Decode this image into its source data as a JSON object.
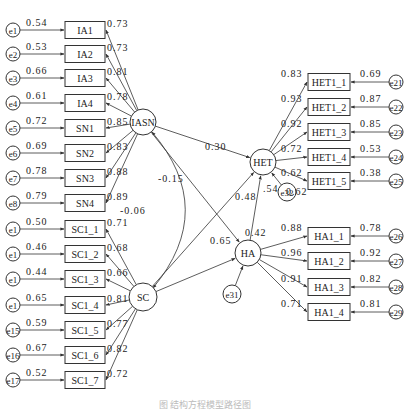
{
  "diagram": {
    "type": "structural-equation-model",
    "latent": [
      {
        "id": "IASN",
        "label": "IASN",
        "x": 143,
        "y": 122,
        "r": 13
      },
      {
        "id": "SC",
        "label": "SC",
        "x": 143,
        "y": 297,
        "r": 14
      },
      {
        "id": "HET",
        "label": "HET",
        "x": 263,
        "y": 162,
        "r": 13
      },
      {
        "id": "HA",
        "label": "HA",
        "x": 248,
        "y": 253,
        "r": 13
      }
    ],
    "left_indicators": [
      {
        "label": "IA1",
        "err": "e1",
        "err_load": "0.54",
        "loading": "0.73",
        "y": 30,
        "factor": "IASN"
      },
      {
        "label": "IA2",
        "err": "e2",
        "err_load": "0.53",
        "loading": "0.73",
        "y": 54,
        "factor": "IASN"
      },
      {
        "label": "IA3",
        "err": "e3",
        "err_load": "0.66",
        "loading": "0.81",
        "y": 78,
        "factor": "IASN"
      },
      {
        "label": "IA4",
        "err": "e4",
        "err_load": "0.61",
        "loading": "0.78",
        "y": 103,
        "factor": "IASN"
      },
      {
        "label": "SN1",
        "err": "e5",
        "err_load": "0.72",
        "loading": "0.85",
        "y": 128,
        "factor": "IASN"
      },
      {
        "label": "SN2",
        "err": "e6",
        "err_load": "0.69",
        "loading": "0.83",
        "y": 153,
        "factor": "IASN"
      },
      {
        "label": "SN3",
        "err": "e7",
        "err_load": "0.78",
        "loading": "0.88",
        "y": 178,
        "factor": "IASN"
      },
      {
        "label": "SN4",
        "err": "e8",
        "err_load": "0.79",
        "loading": "0.89",
        "y": 203,
        "factor": "IASN"
      },
      {
        "label": "SC1_1",
        "err": "e9",
        "err_load": "0.50",
        "loading": "0.71",
        "y": 229,
        "factor": "SC"
      },
      {
        "label": "SC1_2",
        "err": "e10",
        "err_load": "0.46",
        "loading": "0.68",
        "y": 254,
        "factor": "SC"
      },
      {
        "label": "SC1_3",
        "err": "e11",
        "err_load": "0.44",
        "loading": "0.66",
        "y": 279,
        "factor": "SC"
      },
      {
        "label": "SC1_4",
        "err": "e12",
        "err_load": "0.65",
        "loading": "0.81",
        "y": 305,
        "factor": "SC"
      },
      {
        "label": "SC1_5",
        "err": "e13",
        "err_load": "0.59",
        "loading": "0.77",
        "y": 330,
        "factor": "SC"
      },
      {
        "label": "SC1_6",
        "err": "e14",
        "err_load": "0.67",
        "loading": "0.82",
        "y": 355,
        "factor": "SC"
      },
      {
        "label": "SC1_7",
        "err": "e15",
        "err_load": "0.52",
        "loading": "0.72",
        "y": 380,
        "factor": "SC"
      }
    ],
    "left_err_display": [
      "e1",
      "e2",
      "e3",
      "e4",
      "e5",
      "e6",
      "e7",
      "e8",
      "e1",
      "e1",
      "e1",
      "e1",
      "e15",
      "e16",
      "e17"
    ],
    "het_indicators": [
      {
        "label": "HET1_1",
        "err": "e21",
        "err_load": "0.69",
        "loading": "0.83",
        "y": 82
      },
      {
        "label": "HET1_2",
        "err": "e22",
        "err_load": "0.87",
        "loading": "0.93",
        "y": 107
      },
      {
        "label": "HET1_3",
        "err": "e23",
        "err_load": "0.85",
        "loading": "0.92",
        "y": 132
      },
      {
        "label": "HET1_4",
        "err": "e24",
        "err_load": "0.53",
        "loading": "0.72",
        "y": 157
      },
      {
        "label": "HET1_5",
        "err": "e25",
        "err_load": "0.38",
        "loading": "0.62",
        "y": 181
      }
    ],
    "ha_indicators": [
      {
        "label": "HA1_1",
        "err": "e26",
        "err_load": "0.78",
        "loading": "0.88",
        "y": 236
      },
      {
        "label": "HA1_2",
        "err": "e27",
        "err_load": "0.92",
        "loading": "0.96",
        "y": 261
      },
      {
        "label": "HA1_3",
        "err": "e28",
        "err_load": "0.82",
        "loading": "0.91",
        "y": 287
      },
      {
        "label": "HA1_4",
        "err": "e29",
        "err_load": "0.81",
        "loading": "0.71",
        "y": 312
      }
    ],
    "right_err_display": [
      "e21",
      "e22",
      "e23",
      "e24",
      "e25",
      "e26",
      "e27",
      "e28",
      "e29"
    ],
    "structural_paths": [
      {
        "from": "IASN",
        "to": "HET",
        "coef": "0.30"
      },
      {
        "from": "SC",
        "to": "HET",
        "coef": "-0.15"
      },
      {
        "from": "IASN",
        "to": "HA",
        "coef": "0.65"
      },
      {
        "from": "SC",
        "to": "HA",
        "coef": "0.48"
      },
      {
        "from": "HA",
        "to": "HET",
        "coef": "0.42"
      }
    ],
    "covariance": {
      "between": [
        "IASN",
        "SC"
      ],
      "value": "-0.06"
    },
    "disturbances": [
      {
        "id": "e31",
        "target": "HA"
      },
      {
        "id": "e32",
        "target": "HET",
        "r2": ".54"
      }
    ],
    "caption": "图 结构方程模型路径图"
  }
}
